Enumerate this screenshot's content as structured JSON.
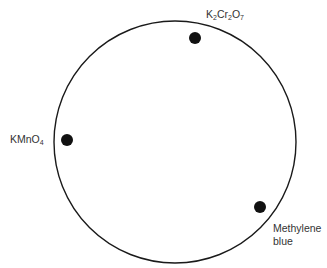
{
  "diagram": {
    "type": "circle-with-spots",
    "circle": {
      "cx": 175,
      "cy": 142,
      "r": 121,
      "stroke": "#1a1a1a",
      "stroke_width": 1.4
    },
    "spots": [
      {
        "id": "k2cr2o7",
        "cx": 195,
        "cy": 38,
        "r": 6,
        "label_parts": [
          {
            "text": "K"
          },
          {
            "sub": "2"
          },
          {
            "text": "Cr"
          },
          {
            "sub": "2"
          },
          {
            "text": "O"
          },
          {
            "sub": "7"
          }
        ],
        "label_plain": "K2Cr2O7"
      },
      {
        "id": "kmno4",
        "cx": 67,
        "cy": 140,
        "r": 6,
        "label_parts": [
          {
            "text": "KMnO"
          },
          {
            "sub": "4"
          }
        ],
        "label_plain": "KMnO4"
      },
      {
        "id": "methylene-blue",
        "cx": 260,
        "cy": 207,
        "r": 6,
        "label_lines": [
          "Methylene",
          "blue"
        ],
        "label_plain": "Methylene blue"
      }
    ],
    "colors": {
      "spot": "#111111",
      "text": "#333333",
      "background": "#ffffff"
    }
  }
}
